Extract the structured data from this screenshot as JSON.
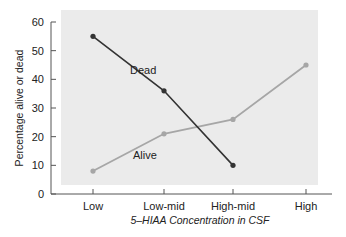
{
  "chart_data": {
    "type": "line",
    "title": "",
    "xlabel": "5–HIAA Concentration in CSF",
    "ylabel": "Percentage alive or dead",
    "categories": [
      "Low",
      "Low-mid",
      "High-mid",
      "High"
    ],
    "ylim": [
      0,
      60
    ],
    "yticks": [
      0,
      10,
      20,
      30,
      40,
      50,
      60
    ],
    "grid": false,
    "legend": "inline labels",
    "series": [
      {
        "name": "Dead",
        "color": "#333333",
        "values": [
          55,
          36,
          10,
          null
        ]
      },
      {
        "name": "Alive",
        "color": "#a6a6a6",
        "values": [
          8,
          21,
          26,
          45
        ]
      }
    ]
  },
  "colors": {
    "plot_background": "#ebebeb",
    "axis": "#555555"
  }
}
